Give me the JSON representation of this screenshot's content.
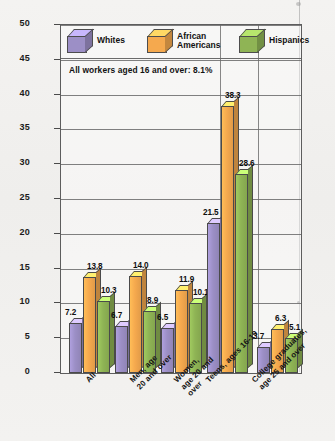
{
  "chart_data": {
    "type": "bar",
    "title": "",
    "xlabel": "",
    "ylabel": "Percentage Unemployed",
    "ylim": [
      0,
      50
    ],
    "yticks": [
      0,
      5,
      10,
      15,
      20,
      25,
      30,
      35,
      40,
      45,
      50
    ],
    "grid": true,
    "legend_position": "inside-top",
    "annotation": "All workers aged 16 and over: 8.1%",
    "categories": [
      "All",
      "Men, age\n20 and over",
      "Women,\nage 20 and\nover",
      "Teens, ages 16-19",
      "College graduates,\nage 25 and over"
    ],
    "series": [
      {
        "name": "Whites",
        "color": "#9c8fc6",
        "values": [
          7.2,
          6.7,
          6.5,
          21.5,
          3.7
        ]
      },
      {
        "name": "African\nAmericans",
        "color": "#f5a94e",
        "values": [
          13.8,
          14.0,
          11.9,
          38.3,
          6.3
        ]
      },
      {
        "name": "Hispanics",
        "color": "#8fb455",
        "values": [
          10.3,
          8.9,
          10.1,
          28.6,
          5.1
        ]
      }
    ],
    "value_labels": [
      [
        "7.2",
        "13.8",
        "10.3"
      ],
      [
        "6.7",
        "14.0",
        "8.9"
      ],
      [
        "6.5",
        "11.9",
        "10.1"
      ],
      [
        "21.5",
        "38.3",
        "28.6"
      ],
      [
        "3.7",
        "6.3",
        "5.1"
      ]
    ]
  },
  "legend": {
    "items": [
      {
        "label": "Whites",
        "color": "#9c8fc6"
      },
      {
        "label": "African\nAmericans",
        "color": "#f5a94e"
      },
      {
        "label": "Hispanics",
        "color": "#8fb455"
      }
    ]
  }
}
